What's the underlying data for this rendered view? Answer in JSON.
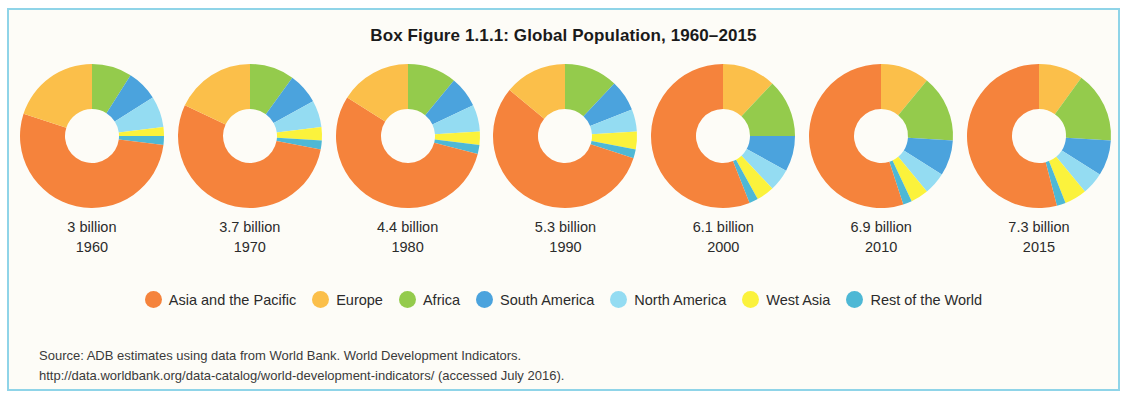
{
  "figure": {
    "title": "Box Figure 1.1.1:  Global Population, 1960–2015",
    "border_color": "#8FD4E8",
    "background_color": "#FDFCF7"
  },
  "source": {
    "line1": "Source:  ADB estimates using data from World Bank. World Development Indicators.",
    "line2": "http://data.worldbank.org/data-catalog/world-development-indicators/ (accessed July 2016)."
  },
  "legend": {
    "items": [
      {
        "label": "Asia and the Pacific",
        "color": "#F5833C"
      },
      {
        "label": "Europe",
        "color": "#FBBF4A"
      },
      {
        "label": "Africa",
        "color": "#94CB4C"
      },
      {
        "label": "South America",
        "color": "#4BA3DD"
      },
      {
        "label": "North America",
        "color": "#94DCF2"
      },
      {
        "label": "West Asia",
        "color": "#FBF23C"
      },
      {
        "label": "Rest of the World",
        "color": "#4EB8D5"
      }
    ]
  },
  "chart_data": {
    "type": "pie",
    "title": "Box Figure 1.1.1:  Global Population, 1960–2015",
    "subtitle": "",
    "xlabel": "",
    "ylabel": "",
    "legend_position": "bottom",
    "grid": false,
    "note": "Seven donut charts, one per year; values are percent share of global population.",
    "categories": [
      "Asia and the Pacific",
      "Europe",
      "Africa",
      "South America",
      "North America",
      "West Asia",
      "Rest of the World"
    ],
    "colors": [
      "#F5833C",
      "#FBBF4A",
      "#94CB4C",
      "#4BA3DD",
      "#94DCF2",
      "#FBF23C",
      "#4EB8D5"
    ],
    "charts": [
      {
        "year": "1960",
        "population_label": "3 billion",
        "start_category": "Africa",
        "values": [
          53,
          20,
          9,
          7,
          7,
          2,
          2
        ],
        "series": [
          {
            "name": "Asia and the Pacific",
            "value": 53
          },
          {
            "name": "Europe",
            "value": 20
          },
          {
            "name": "Africa",
            "value": 9
          },
          {
            "name": "South America",
            "value": 7
          },
          {
            "name": "North America",
            "value": 7
          },
          {
            "name": "West Asia",
            "value": 2
          },
          {
            "name": "Rest of the World",
            "value": 2
          }
        ]
      },
      {
        "year": "1970",
        "population_label": "3.7 billion",
        "start_category": "Africa",
        "values": [
          54,
          18,
          10,
          7,
          6,
          3,
          2
        ],
        "series": [
          {
            "name": "Asia and the Pacific",
            "value": 54
          },
          {
            "name": "Europe",
            "value": 18
          },
          {
            "name": "Africa",
            "value": 10
          },
          {
            "name": "South America",
            "value": 7
          },
          {
            "name": "North America",
            "value": 6
          },
          {
            "name": "West Asia",
            "value": 3
          },
          {
            "name": "Rest of the World",
            "value": 2
          }
        ]
      },
      {
        "year": "1980",
        "population_label": "4.4 billion",
        "start_category": "Africa",
        "values": [
          55,
          16,
          11,
          7,
          6,
          3,
          2
        ],
        "series": [
          {
            "name": "Asia and the Pacific",
            "value": 55
          },
          {
            "name": "Europe",
            "value": 16
          },
          {
            "name": "Africa",
            "value": 11
          },
          {
            "name": "South America",
            "value": 7
          },
          {
            "name": "North America",
            "value": 6
          },
          {
            "name": "West Asia",
            "value": 3
          },
          {
            "name": "Rest of the World",
            "value": 2
          }
        ]
      },
      {
        "year": "1990",
        "population_label": "5.3 billion",
        "start_category": "Africa",
        "values": [
          56,
          14,
          12,
          7,
          5,
          4,
          2
        ],
        "series": [
          {
            "name": "Asia and the Pacific",
            "value": 56
          },
          {
            "name": "Europe",
            "value": 14
          },
          {
            "name": "Africa",
            "value": 12
          },
          {
            "name": "South America",
            "value": 7
          },
          {
            "name": "North America",
            "value": 5
          },
          {
            "name": "West Asia",
            "value": 4
          },
          {
            "name": "Rest of the World",
            "value": 2
          }
        ]
      },
      {
        "year": "2000",
        "population_label": "6.1 billion",
        "start_category": "Europe",
        "values": [
          56,
          12,
          13,
          8,
          5,
          4,
          2
        ],
        "series": [
          {
            "name": "Asia and the Pacific",
            "value": 56
          },
          {
            "name": "Europe",
            "value": 12
          },
          {
            "name": "Africa",
            "value": 13
          },
          {
            "name": "South America",
            "value": 8
          },
          {
            "name": "North America",
            "value": 5
          },
          {
            "name": "West Asia",
            "value": 4
          },
          {
            "name": "Rest of the World",
            "value": 2
          }
        ]
      },
      {
        "year": "2010",
        "population_label": "6.9 billion",
        "start_category": "Europe",
        "values": [
          55,
          11,
          15,
          8,
          5,
          4,
          2
        ],
        "series": [
          {
            "name": "Asia and the Pacific",
            "value": 55
          },
          {
            "name": "Europe",
            "value": 11
          },
          {
            "name": "Africa",
            "value": 15
          },
          {
            "name": "South America",
            "value": 8
          },
          {
            "name": "North America",
            "value": 5
          },
          {
            "name": "West Asia",
            "value": 4
          },
          {
            "name": "Rest of the World",
            "value": 2
          }
        ]
      },
      {
        "year": "2015",
        "population_label": "7.3 billion",
        "start_category": "Europe",
        "values": [
          54,
          10,
          16,
          8,
          5,
          5,
          2
        ],
        "series": [
          {
            "name": "Asia and the Pacific",
            "value": 54
          },
          {
            "name": "Europe",
            "value": 10
          },
          {
            "name": "Africa",
            "value": 16
          },
          {
            "name": "South America",
            "value": 8
          },
          {
            "name": "North America",
            "value": 5
          },
          {
            "name": "West Asia",
            "value": 5
          },
          {
            "name": "Rest of the World",
            "value": 2
          }
        ]
      }
    ]
  }
}
